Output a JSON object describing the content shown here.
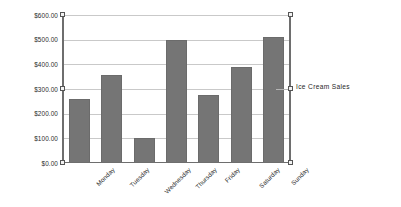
{
  "chart_data": {
    "type": "bar",
    "title": "",
    "xlabel": "",
    "ylabel": "",
    "categories": [
      "Monday",
      "Tuesday",
      "Wednesday",
      "Thursday",
      "Friday",
      "Saturday",
      "Sunday"
    ],
    "values": [
      258,
      355,
      100,
      497,
      275,
      390,
      512
    ],
    "series": [
      {
        "name": "Ice Cream Sales",
        "values": [
          258,
          355,
          100,
          497,
          275,
          390,
          512
        ]
      }
    ],
    "ylim": [
      0,
      600
    ],
    "ytick_values": [
      0,
      100,
      200,
      300,
      400,
      500,
      600
    ],
    "ytick_labels": [
      "$0.00",
      "$100.00",
      "$200.00",
      "$300.00",
      "$400.00",
      "$500.00",
      "$600.00"
    ],
    "grid": true,
    "legend": [
      "Ice Cream Sales"
    ],
    "legend_position": "right",
    "bar_color": "#757575",
    "gridline_color": "#c9c9c9",
    "axis_color": "#6e6e6e"
  },
  "legend": {
    "label": "Ice Cream Sales"
  },
  "selection": {
    "handles": [
      {
        "name": "handle-top-left",
        "x": 60,
        "y": 12
      },
      {
        "name": "handle-top-right",
        "x": 288,
        "y": 12
      },
      {
        "name": "handle-middle-left",
        "x": 60,
        "y": 86
      },
      {
        "name": "handle-middle-right",
        "x": 288,
        "y": 86
      },
      {
        "name": "handle-bottom-left",
        "x": 60,
        "y": 160
      },
      {
        "name": "handle-bottom-right",
        "x": 288,
        "y": 160
      }
    ]
  }
}
